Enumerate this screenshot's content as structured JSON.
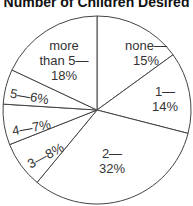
{
  "chart_data": {
    "type": "pie",
    "title": "Number of Children Desired",
    "categories": [
      "none",
      "1",
      "2",
      "3",
      "4",
      "5",
      "more than 5"
    ],
    "values": [
      15,
      14,
      32,
      8,
      7,
      6,
      18
    ],
    "unit": "%",
    "start_angle": "12 o'clock",
    "direction": "clockwise",
    "labels": [
      {
        "line1": "none—",
        "line2": "15%"
      },
      {
        "line1": "1—",
        "line2": "14%"
      },
      {
        "line1": "2—",
        "line2": "32%"
      },
      {
        "line1": "3—8%",
        "line2": ""
      },
      {
        "line1": "4—7%",
        "line2": ""
      },
      {
        "line1": "5—6%",
        "line2": ""
      },
      {
        "line1": "more",
        "line2": "than 5—",
        "line3": "18%"
      }
    ]
  },
  "colors": {
    "fill": "#ffffff",
    "stroke": "#444444",
    "text": "#333333"
  }
}
